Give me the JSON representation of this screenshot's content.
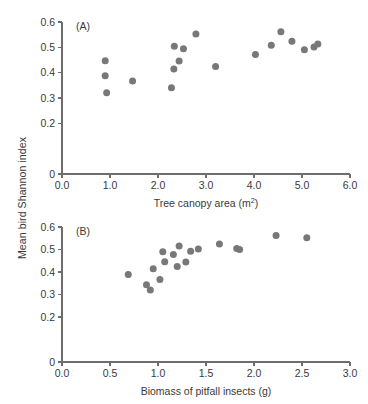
{
  "figure": {
    "y_axis_label": "Mean bird Shannon index",
    "marker_color": "#787878",
    "axis_color": "#6d6d6d",
    "text_color": "#3a3a3a"
  },
  "panel_a": {
    "tag": "(A)",
    "xlabel_main": "Tree canopy area (m",
    "xlabel_sup": "2",
    "xlabel_tail": ")",
    "xtick_labels": [
      "0.0",
      "1.0",
      "2.0",
      "3.0",
      "4.0",
      "5.0",
      "6.0"
    ],
    "ytick_labels": [
      "0",
      "0.2",
      "0.3",
      "0.4",
      "0.5",
      "0.6"
    ]
  },
  "panel_b": {
    "tag": "(B)",
    "xlabel_main": "Biomass of pitfall insects (g)",
    "xtick_labels": [
      "0.0",
      "0.5",
      "1.0",
      "1.5",
      "2.0",
      "2.5",
      "3.0"
    ],
    "ytick_labels": [
      "0",
      "0.2",
      "0.3",
      "0.4",
      "0.5",
      "0.6"
    ]
  },
  "chart_data": [
    {
      "type": "scatter",
      "panel": "(A)",
      "title": "",
      "xlabel": "Tree canopy area (m2)",
      "ylabel": "Mean bird Shannon index",
      "xlim": [
        0.0,
        6.0
      ],
      "ylim": [
        0.0,
        0.6
      ],
      "xticks": [
        0.0,
        1.0,
        2.0,
        3.0,
        4.0,
        5.0,
        6.0
      ],
      "yticks": [
        0.0,
        0.2,
        0.3,
        0.4,
        0.5,
        0.6
      ],
      "ytick_labels": [
        "0",
        "0.2",
        "0.3",
        "0.4",
        "0.5",
        "0.6"
      ],
      "grid": false,
      "legend": "none",
      "points": [
        {
          "x": 0.9,
          "y": 0.447
        },
        {
          "x": 0.9,
          "y": 0.388
        },
        {
          "x": 0.93,
          "y": 0.321
        },
        {
          "x": 1.47,
          "y": 0.367
        },
        {
          "x": 2.28,
          "y": 0.34
        },
        {
          "x": 2.33,
          "y": 0.414
        },
        {
          "x": 2.34,
          "y": 0.504
        },
        {
          "x": 2.44,
          "y": 0.446
        },
        {
          "x": 2.53,
          "y": 0.494
        },
        {
          "x": 2.79,
          "y": 0.553
        },
        {
          "x": 3.2,
          "y": 0.424
        },
        {
          "x": 4.03,
          "y": 0.472
        },
        {
          "x": 4.36,
          "y": 0.508
        },
        {
          "x": 4.56,
          "y": 0.562
        },
        {
          "x": 4.79,
          "y": 0.524
        },
        {
          "x": 5.05,
          "y": 0.49
        },
        {
          "x": 5.25,
          "y": 0.501
        },
        {
          "x": 5.33,
          "y": 0.513
        }
      ]
    },
    {
      "type": "scatter",
      "panel": "(B)",
      "title": "",
      "xlabel": "Biomass of pitfall insects (g)",
      "ylabel": "Mean bird Shannon index",
      "xlim": [
        0.0,
        3.0
      ],
      "ylim": [
        0.0,
        0.6
      ],
      "xticks": [
        0.0,
        0.5,
        1.0,
        1.5,
        2.0,
        2.5,
        3.0
      ],
      "yticks": [
        0.0,
        0.2,
        0.3,
        0.4,
        0.5,
        0.6
      ],
      "ytick_labels": [
        "0",
        "0.2",
        "0.3",
        "0.4",
        "0.5",
        "0.6"
      ],
      "grid": false,
      "legend": "none",
      "points": [
        {
          "x": 0.69,
          "y": 0.389
        },
        {
          "x": 0.88,
          "y": 0.343
        },
        {
          "x": 0.92,
          "y": 0.32
        },
        {
          "x": 0.95,
          "y": 0.414
        },
        {
          "x": 1.02,
          "y": 0.367
        },
        {
          "x": 1.05,
          "y": 0.49
        },
        {
          "x": 1.07,
          "y": 0.446
        },
        {
          "x": 1.16,
          "y": 0.478
        },
        {
          "x": 1.2,
          "y": 0.425
        },
        {
          "x": 1.22,
          "y": 0.516
        },
        {
          "x": 1.29,
          "y": 0.444
        },
        {
          "x": 1.34,
          "y": 0.492
        },
        {
          "x": 1.42,
          "y": 0.502
        },
        {
          "x": 1.64,
          "y": 0.525
        },
        {
          "x": 1.82,
          "y": 0.505
        },
        {
          "x": 1.85,
          "y": 0.5
        },
        {
          "x": 2.23,
          "y": 0.562
        },
        {
          "x": 2.55,
          "y": 0.552
        }
      ]
    }
  ]
}
